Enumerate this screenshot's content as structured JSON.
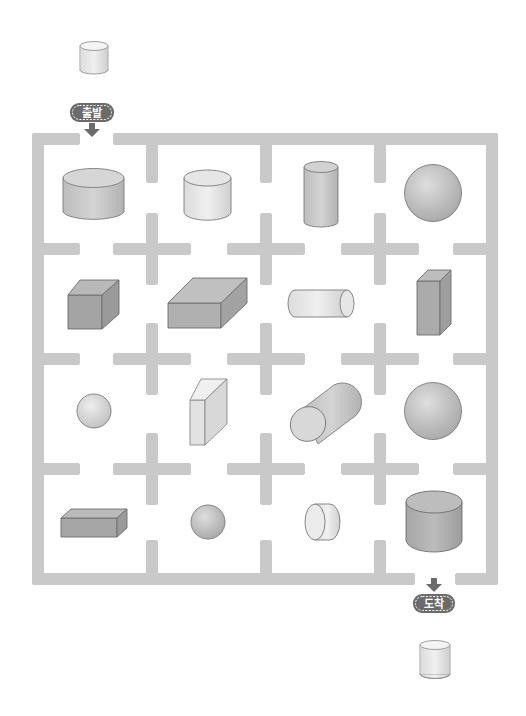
{
  "puzzle": {
    "type": "shape-maze",
    "start_label": "출발",
    "end_label": "도착",
    "start_shape": "cylinder",
    "end_shape": "cylinder"
  },
  "colors": {
    "wall": "#c9c9c9",
    "wall_dot": "#e6e6e6",
    "badge": "#6b6b6b",
    "arrow": "#6b6b6b",
    "shape_light": "#e4e4e4",
    "shape_mid": "#c4c4c4",
    "shape_dark": "#9e9e9e",
    "outline": "#7a7a7a"
  },
  "grid": {
    "rows": 4,
    "cols": 4,
    "cells": [
      [
        "wide-cylinder",
        "cylinder",
        "tall-cylinder",
        "sphere"
      ],
      [
        "cube",
        "flat-box",
        "lying-cylinder",
        "tall-box"
      ],
      [
        "small-sphere",
        "thin-slab",
        "tilted-cylinder",
        "sphere"
      ],
      [
        "long-box",
        "small-sphere",
        "disk-cylinder",
        "big-cylinder"
      ]
    ]
  }
}
